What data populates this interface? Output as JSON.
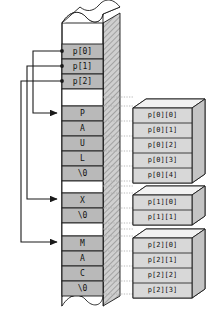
{
  "diagram": {
    "type": "memory-layout-diagram",
    "colors": {
      "cell_fill": "#b9b9b9",
      "gap_fill": "#ffffff",
      "side_face": "#c9c9c9",
      "box_fill": "#d8d8d8",
      "box_top": "#f0f0f0",
      "outline": "#1a1a1a",
      "guide": "#9a9a9a"
    }
  },
  "pointer_array": {
    "name": "p",
    "label": "pointer array cells",
    "cells": [
      {
        "label": "p[0]",
        "points_to": "paul"
      },
      {
        "label": "p[1]",
        "points_to": "x"
      },
      {
        "label": "p[2]",
        "points_to": "mac"
      }
    ]
  },
  "memory_column": {
    "top_break": "wavy-break-top",
    "bottom_break": "wavy-break-bottom",
    "blocks": [
      {
        "id": "paul",
        "string": "PAUL",
        "cells": [
          {
            "char": "P",
            "index_label": "p[0][0]"
          },
          {
            "char": "A",
            "index_label": "p[0][1]"
          },
          {
            "char": "U",
            "index_label": "p[0][2]"
          },
          {
            "char": "L",
            "index_label": "p[0][3]"
          },
          {
            "char": "\\0",
            "index_label": "p[0][4]"
          }
        ]
      },
      {
        "id": "x",
        "string": "X",
        "cells": [
          {
            "char": "X",
            "index_label": "p[1][0]"
          },
          {
            "char": "\\0",
            "index_label": "p[1][1]"
          }
        ]
      },
      {
        "id": "mac",
        "string": "MAC",
        "cells": [
          {
            "char": "M",
            "index_label": "p[2][0]"
          },
          {
            "char": "A",
            "index_label": "p[2][1]"
          },
          {
            "char": "C",
            "index_label": "p[2][2]"
          },
          {
            "char": "\\0",
            "index_label": "p[2][3]"
          }
        ]
      }
    ]
  },
  "index_boxes": [
    {
      "id": "box-0",
      "labels": [
        "p[0][0]",
        "p[0][1]",
        "p[0][2]",
        "p[0][3]",
        "p[0][4]"
      ]
    },
    {
      "id": "box-1",
      "labels": [
        "p[1][0]",
        "p[1][1]"
      ]
    },
    {
      "id": "box-2",
      "labels": [
        "p[2][0]",
        "p[2][1]",
        "p[2][2]",
        "p[2][3]"
      ]
    }
  ],
  "arrows": [
    {
      "from": "p[0]",
      "to": "paul",
      "style": "elbow-left"
    },
    {
      "from": "p[1]",
      "to": "x",
      "style": "elbow-left"
    },
    {
      "from": "p[2]",
      "to": "mac",
      "style": "elbow-left"
    }
  ]
}
